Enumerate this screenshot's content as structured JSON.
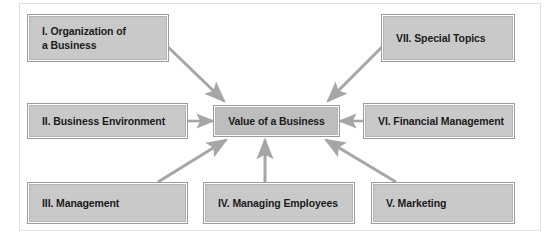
{
  "figure": {
    "frame_color": "#e2e2e2",
    "background": "#ffffff",
    "node_fill": "#c9c9c9",
    "center_node_fill": "#bdbdbd",
    "node_border": "#9b9b9b",
    "arrow_color": "#a6a6a6",
    "text_color": "#1b1b1b"
  },
  "center": {
    "label": "Value of a Business"
  },
  "nodes": [
    {
      "id": "i",
      "label": "I.  Organization of\n     a Business",
      "numeral": "I",
      "name": "Organization of a Business"
    },
    {
      "id": "ii",
      "label": "II.  Business Environment",
      "numeral": "II",
      "name": "Business Environment"
    },
    {
      "id": "iii",
      "label": "III.  Management",
      "numeral": "III",
      "name": "Management"
    },
    {
      "id": "iv",
      "label": "IV.  Managing Employees",
      "numeral": "IV",
      "name": "Managing Employees"
    },
    {
      "id": "v",
      "label": "V.  Marketing",
      "numeral": "V",
      "name": "Marketing"
    },
    {
      "id": "vi",
      "label": "VI.  Financial Management",
      "numeral": "VI",
      "name": "Financial Management"
    },
    {
      "id": "vii",
      "label": "VII.  Special Topics",
      "numeral": "VII",
      "name": "Special Topics"
    }
  ],
  "arrows": [
    {
      "from": "i",
      "to": "center",
      "direction": "down-right"
    },
    {
      "from": "vii",
      "to": "center",
      "direction": "down-left"
    },
    {
      "from": "ii",
      "to": "center",
      "direction": "right"
    },
    {
      "from": "vi",
      "to": "center",
      "direction": "left"
    },
    {
      "from": "iii",
      "to": "center",
      "direction": "up-right"
    },
    {
      "from": "iv",
      "to": "center",
      "direction": "up"
    },
    {
      "from": "v",
      "to": "center",
      "direction": "up-left"
    }
  ]
}
